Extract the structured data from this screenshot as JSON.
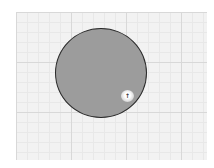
{
  "canvas": {
    "background": "#ffffff",
    "grid_color": "#f2f2f2",
    "grid_line_color": "#d8d8d8"
  },
  "shape": {
    "type": "circle",
    "fill": "#9c9c9c",
    "stroke": "#2a2a2a"
  },
  "marker": {
    "icon": "pin-icon",
    "glyph": "↑"
  }
}
